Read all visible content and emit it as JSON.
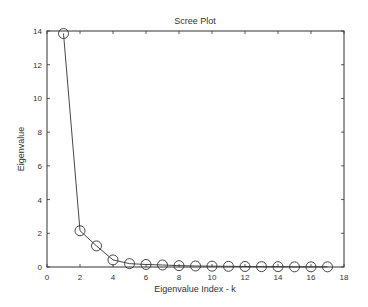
{
  "chart_data": {
    "type": "line",
    "title": "Scree Plot",
    "xlabel": "Eigenvalue Index - k",
    "ylabel": "Eigenvalue",
    "xlim": [
      0,
      18
    ],
    "ylim": [
      0,
      14
    ],
    "xticks": [
      0,
      2,
      4,
      6,
      8,
      10,
      12,
      14,
      16,
      18
    ],
    "yticks": [
      0,
      2,
      4,
      6,
      8,
      10,
      12,
      14
    ],
    "grid": false,
    "legend": null,
    "marker": "circle",
    "series": [
      {
        "name": "Eigenvalue",
        "x": [
          1,
          2,
          3,
          4,
          5,
          6,
          7,
          8,
          9,
          10,
          11,
          12,
          13,
          14,
          15,
          16,
          17
        ],
        "values": [
          13.85,
          2.15,
          1.25,
          0.42,
          0.2,
          0.15,
          0.12,
          0.08,
          0.06,
          0.05,
          0.04,
          0.03,
          0.02,
          0.02,
          0.01,
          0.01,
          0.01
        ]
      }
    ]
  },
  "colors": {
    "line": "#333333",
    "axis": "#333333",
    "background": "#ffffff"
  }
}
